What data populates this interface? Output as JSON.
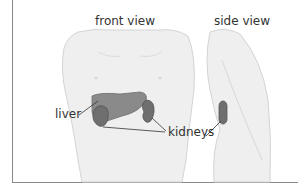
{
  "diagram": {
    "views": [
      {
        "id": "front",
        "label": "front view"
      },
      {
        "id": "side",
        "label": "side view"
      }
    ],
    "organ_labels": {
      "liver": "liver",
      "kidneys": "kidneys"
    },
    "colors": {
      "body_fill": "#efefef",
      "body_stroke": "#d4d4d4",
      "organ_fill": "#7d7d7d",
      "organ_dark": "#5e5e5e",
      "leader_line": "#333333",
      "frame": "#8a8a8a"
    }
  }
}
